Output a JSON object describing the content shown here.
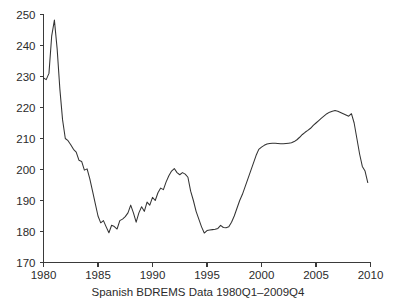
{
  "chart_data": {
    "type": "line",
    "title": "",
    "subtitle": "",
    "xlabel": "Spanish BDREMS Data 1980Q1–2009Q4",
    "ylabel": "",
    "xlim": [
      1980,
      2010
    ],
    "ylim": [
      170,
      250
    ],
    "grid": false,
    "legend": null,
    "legend_position": "none",
    "xticks": [
      1980,
      1985,
      1990,
      1995,
      2000,
      2005,
      2010
    ],
    "xtick_labels": [
      "1980",
      "1985",
      "1990",
      "1995",
      "2000",
      "2005",
      "2010"
    ],
    "yticks": [
      170,
      180,
      190,
      200,
      210,
      220,
      230,
      240,
      250
    ],
    "ytick_labels": [
      "170",
      "180",
      "190",
      "200",
      "210",
      "220",
      "230",
      "240",
      "250"
    ],
    "line_color": "#333333",
    "series": [
      {
        "name": "Spanish BDREMS",
        "x": [
          1980.0,
          1980.25,
          1980.5,
          1980.75,
          1981.0,
          1981.25,
          1981.5,
          1981.75,
          1982.0,
          1982.25,
          1982.5,
          1982.75,
          1983.0,
          1983.25,
          1983.5,
          1983.75,
          1984.0,
          1984.25,
          1984.5,
          1984.75,
          1985.0,
          1985.25,
          1985.5,
          1985.75,
          1986.0,
          1986.25,
          1986.5,
          1986.75,
          1987.0,
          1987.25,
          1987.5,
          1987.75,
          1988.0,
          1988.25,
          1988.5,
          1988.75,
          1989.0,
          1989.25,
          1989.5,
          1989.75,
          1990.0,
          1990.25,
          1990.5,
          1990.75,
          1991.0,
          1991.25,
          1991.5,
          1991.75,
          1992.0,
          1992.25,
          1992.5,
          1992.75,
          1993.0,
          1993.25,
          1993.5,
          1993.75,
          1994.0,
          1994.25,
          1994.5,
          1994.75,
          1995.0,
          1995.25,
          1995.5,
          1995.75,
          1996.0,
          1996.25,
          1996.5,
          1996.75,
          1997.0,
          1997.25,
          1997.5,
          1997.75,
          1998.0,
          1998.25,
          1998.5,
          1998.75,
          1999.0,
          1999.25,
          1999.5,
          1999.75,
          2000.0,
          2000.25,
          2000.5,
          2000.75,
          2001.0,
          2001.25,
          2001.5,
          2001.75,
          2002.0,
          2002.25,
          2002.5,
          2002.75,
          2003.0,
          2003.25,
          2003.5,
          2003.75,
          2004.0,
          2004.25,
          2004.5,
          2004.75,
          2005.0,
          2005.25,
          2005.5,
          2005.75,
          2006.0,
          2006.25,
          2006.5,
          2006.75,
          2007.0,
          2007.25,
          2007.5,
          2007.75,
          2008.0,
          2008.25,
          2008.5,
          2008.75,
          2009.0,
          2009.25,
          2009.5,
          2009.75
        ],
        "values": [
          229.5,
          229.0,
          231.0,
          243.0,
          248.2,
          239.0,
          226.0,
          216.0,
          210.0,
          209.3,
          208.0,
          206.5,
          205.6,
          203.0,
          202.6,
          199.8,
          200.2,
          197.0,
          193.0,
          189.0,
          185.0,
          182.8,
          183.5,
          181.5,
          179.6,
          182.0,
          181.6,
          180.8,
          183.5,
          184.0,
          184.8,
          186.0,
          188.5,
          186.0,
          183.0,
          186.0,
          188.0,
          186.5,
          189.5,
          188.5,
          191.0,
          190.0,
          192.5,
          194.0,
          193.5,
          196.0,
          198.0,
          199.5,
          200.3,
          199.0,
          198.3,
          199.0,
          198.5,
          197.5,
          193.0,
          190.0,
          186.5,
          184.0,
          181.5,
          179.5,
          180.3,
          180.5,
          180.6,
          180.7,
          181.0,
          182.0,
          181.3,
          181.2,
          181.5,
          183.0,
          185.0,
          187.5,
          190.0,
          192.0,
          194.5,
          197.0,
          199.5,
          202.0,
          204.5,
          206.5,
          207.2,
          207.8,
          208.2,
          208.4,
          208.5,
          208.5,
          208.4,
          208.3,
          208.3,
          208.4,
          208.5,
          208.6,
          209.0,
          209.6,
          210.4,
          211.3,
          212.0,
          212.6,
          213.3,
          214.2,
          215.0,
          215.8,
          216.6,
          217.3,
          218.0,
          218.5,
          218.8,
          219.0,
          218.8,
          218.4,
          218.0,
          217.6,
          217.2,
          218.0,
          215.0,
          210.0,
          205.0,
          201.0,
          199.5,
          195.8
        ]
      }
    ]
  },
  "caption": {
    "text": "Spanish BDREMS Data 1980Q1–2009Q4"
  },
  "axes": {
    "y_axis_name": "value-axis",
    "x_axis_name": "year-axis"
  }
}
